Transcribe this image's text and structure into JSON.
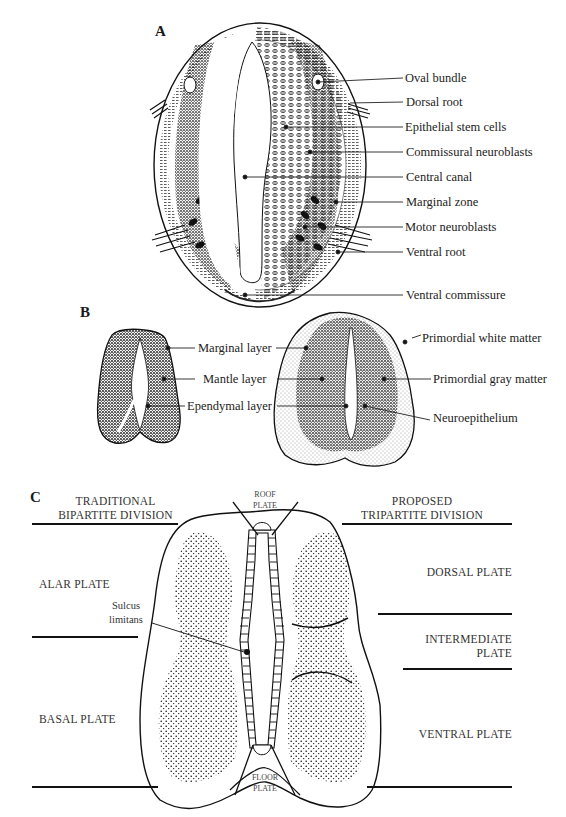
{
  "figure": {
    "panels": [
      {
        "id": "A",
        "label": "A",
        "labels": [
          "Oval bundle",
          "Dorsal root",
          "Epithelial stem cells",
          "Commissural neuroblasts",
          "Central canal",
          "Marginal zone",
          "Motor neuroblasts",
          "Ventral root",
          "Ventral commissure"
        ]
      },
      {
        "id": "B",
        "label": "B",
        "labels_center": [
          "Marginal layer",
          "Mantle layer",
          "Ependymal layer"
        ],
        "labels_right": [
          "Primordial white matter",
          "Primordial gray matter",
          "Neuroepithelium"
        ]
      },
      {
        "id": "C",
        "label": "C",
        "left_heading": [
          "TRADITIONAL",
          "BIPARTITE DIVISION"
        ],
        "right_heading": [
          "PROPOSED",
          "TRIPARTITE DIVISION"
        ],
        "left_regions": [
          "ALAR PLATE",
          "BASAL PLATE"
        ],
        "right_regions": [
          "DORSAL PLATE",
          "INTERMEDIATE PLATE",
          "VENTRAL PLATE"
        ],
        "right_intermediate_lines": [
          "INTERMEDIATE",
          "PLATE"
        ],
        "roof": [
          "ROOF",
          "PLATE"
        ],
        "floor": [
          "FLOOR",
          "PLATE"
        ],
        "sulcus": [
          "Sulcus",
          "limitans"
        ]
      }
    ]
  }
}
